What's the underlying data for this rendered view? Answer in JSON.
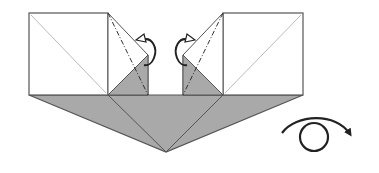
{
  "diagram": {
    "type": "origami-step",
    "colors": {
      "paper_front": "#ffffff",
      "paper_back": "#a9a9a9",
      "outline": "#555555",
      "crease": "#b8b8b8",
      "arrow": "#222222"
    },
    "elements": [
      {
        "id": "left-square",
        "kind": "white paper square with diagonal crease"
      },
      {
        "id": "right-square",
        "kind": "white paper square with diagonal crease"
      },
      {
        "id": "left-flap",
        "kind": "flap with mountain-fold dash-dot line and fold-behind arrow"
      },
      {
        "id": "right-flap",
        "kind": "flap with mountain-fold dash-dot line and fold-behind arrow"
      },
      {
        "id": "bottom-triangle",
        "kind": "grey colored-side triangular base"
      },
      {
        "id": "turn-over-arrow",
        "kind": "turn model over symbol"
      }
    ],
    "labels": {
      "title": "Origami folding step diagram"
    }
  }
}
